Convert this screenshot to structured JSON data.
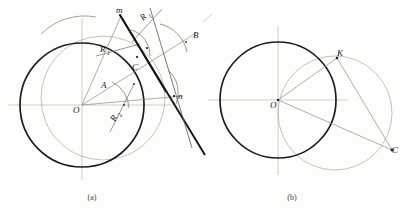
{
  "figure": {
    "background": "#fdfdfb",
    "ink_dark": "#1b1b1b",
    "ink_mid": "#6f6f6f",
    "ink_light": "#a8a8a8",
    "ink_faint": "#c9c7c3",
    "panels": [
      {
        "id": "a",
        "caption": "(a)",
        "caption_x": 92,
        "caption_y": 200,
        "labels": [
          {
            "name": "label-O",
            "text": "O",
            "sub": "",
            "x": 73,
            "y": 113,
            "rotate": 0
          },
          {
            "name": "label-m",
            "text": "m",
            "sub": "",
            "x": 116,
            "y": 13,
            "rotate": 0
          },
          {
            "name": "label-R1-upper",
            "text": "R",
            "sub": "1",
            "x": 143,
            "y": 21,
            "rotate": -42
          },
          {
            "name": "label-R1-left",
            "text": "R",
            "sub": "1",
            "x": 100,
            "y": 52,
            "rotate": 0
          },
          {
            "name": "label-R2",
            "text": "R",
            "sub": "2",
            "x": 115,
            "y": 122,
            "rotate": -62
          },
          {
            "name": "label-A",
            "text": "A",
            "sub": "",
            "x": 101,
            "y": 88,
            "rotate": 0
          },
          {
            "name": "label-B",
            "text": "B",
            "sub": "",
            "x": 193,
            "y": 38,
            "rotate": 0
          },
          {
            "name": "label-C",
            "text": "C",
            "sub": "",
            "x": 132,
            "y": 70,
            "rotate": 0
          },
          {
            "name": "label-n",
            "text": "n",
            "sub": "",
            "x": 178,
            "y": 99,
            "rotate": 0
          }
        ],
        "main_circle": {
          "cx": 82,
          "cy": 105,
          "r": 62
        },
        "secondary_circle": {
          "cx": 103,
          "cy": 98,
          "r": 62
        }
      },
      {
        "id": "b",
        "caption": "(b)",
        "caption_x": 292,
        "caption_y": 200,
        "labels": [
          {
            "name": "label-O",
            "text": "O",
            "sub": "",
            "x": 270,
            "y": 108,
            "rotate": 0
          },
          {
            "name": "label-K",
            "text": "K",
            "sub": "",
            "x": 337,
            "y": 56,
            "rotate": 0
          },
          {
            "name": "label-C",
            "text": "C",
            "sub": "",
            "x": 392,
            "y": 153,
            "rotate": 0
          }
        ],
        "main_circle": {
          "cx": 278,
          "cy": 100,
          "r": 58
        },
        "secondary_circle": {
          "cx": 335,
          "cy": 113,
          "r": 57
        }
      }
    ],
    "bottom_caption": ""
  }
}
